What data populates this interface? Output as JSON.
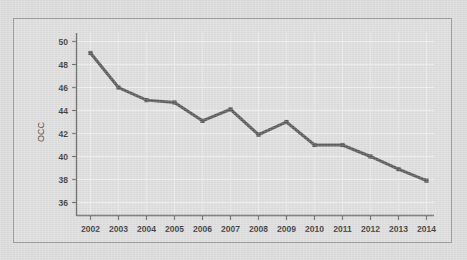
{
  "figure": {
    "background_color": "#dcdcdc",
    "panel_color": "#dedede",
    "frame_color": "#9a9a9a",
    "series_color": "#5a5a5a",
    "grid_color": "#efefef",
    "axis_color": "#6d6d6d",
    "text_color": "#3b3b3b"
  },
  "chart_data": {
    "type": "line",
    "title": "",
    "xlabel": "",
    "ylabel": "OCC",
    "categories": [
      "2002",
      "2003",
      "2004",
      "2005",
      "2006",
      "2007",
      "2008",
      "2009",
      "2010",
      "2011",
      "2012",
      "2013",
      "2014"
    ],
    "values": [
      49.0,
      46.0,
      44.9,
      44.7,
      43.1,
      44.1,
      41.9,
      43.0,
      41.0,
      41.0,
      40.0,
      38.9,
      37.9
    ],
    "series": [
      {
        "name": "OCC",
        "values": [
          49.0,
          46.0,
          44.9,
          44.7,
          43.1,
          44.1,
          41.9,
          43.0,
          41.0,
          41.0,
          40.0,
          38.9,
          37.9
        ]
      }
    ],
    "x_tick_labels": [
      "2002",
      "2003",
      "2004",
      "2005",
      "2006",
      "2007",
      "2008",
      "2009",
      "2010",
      "2011",
      "2012",
      "2013",
      "2014"
    ],
    "y_tick_labels": [
      "36",
      "38",
      "40",
      "42",
      "44",
      "46",
      "48",
      "50"
    ],
    "y_ticks": [
      36,
      38,
      40,
      42,
      44,
      46,
      48,
      50
    ],
    "ylim": [
      34.8,
      50.6
    ],
    "xlim": [
      2001.5,
      2014.6
    ],
    "grid": true,
    "grid_axis": "both",
    "legend": false,
    "legend_position": "none",
    "marker": "square",
    "line_width": 3
  }
}
